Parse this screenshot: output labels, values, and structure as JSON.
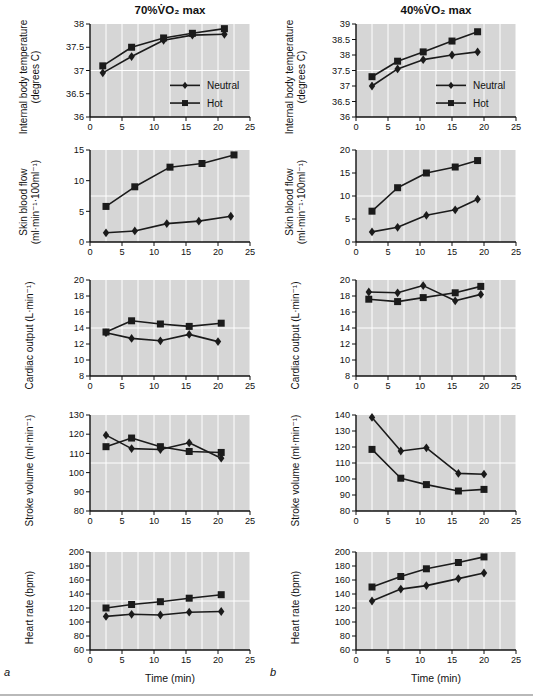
{
  "figure": {
    "panel_a_letter": "a",
    "panel_b_letter": "b",
    "legend_labels": {
      "neutral": "Neutral",
      "hot": "Hot"
    },
    "grid": {
      "x_step": 2.5,
      "y_mid_line": true,
      "style": "white gridlines on gray plot background"
    }
  },
  "colors": {
    "page_bg": "#ffffff",
    "plot_bg": "#d6d6d6",
    "gridline": "#ffffff",
    "series_line": "#1b1b1b",
    "text": "#111111",
    "bottom_rule": "#b9b9b9"
  },
  "chart_data": [
    {
      "id": "temp-70",
      "type": "line",
      "title": "70%V̇O₂ max",
      "ylabel_lines": [
        "Internal body temperature",
        "(degrees C)"
      ],
      "ylim": [
        36,
        38
      ],
      "yticks": [
        36,
        36.5,
        37,
        37.5,
        38
      ],
      "xlim": [
        0,
        25
      ],
      "xticks": [
        0,
        5,
        10,
        15,
        20,
        25
      ],
      "xlabel": "",
      "legend": true,
      "panel_letter": "",
      "series": [
        {
          "name": "Neutral",
          "marker": "diamond",
          "points": [
            [
              2,
              36.95
            ],
            [
              6.5,
              37.3
            ],
            [
              11.5,
              37.65
            ],
            [
              16,
              37.76
            ],
            [
              21,
              37.78
            ]
          ]
        },
        {
          "name": "Hot",
          "marker": "square",
          "points": [
            [
              2,
              37.1
            ],
            [
              6.5,
              37.5
            ],
            [
              11.5,
              37.7
            ],
            [
              16,
              37.8
            ],
            [
              21,
              37.9
            ]
          ]
        }
      ]
    },
    {
      "id": "temp-40",
      "type": "line",
      "title": "40%V̇O₂ max",
      "ylabel_lines": [
        "Internal body temperature",
        "(degrees C)"
      ],
      "ylim": [
        36,
        39
      ],
      "yticks": [
        36,
        36.5,
        37,
        37.5,
        38,
        38.5,
        39
      ],
      "xlim": [
        0,
        25
      ],
      "xticks": [
        0,
        5,
        10,
        15,
        20,
        25
      ],
      "xlabel": "",
      "legend": true,
      "panel_letter": "",
      "series": [
        {
          "name": "Neutral",
          "marker": "diamond",
          "points": [
            [
              2.5,
              37.0
            ],
            [
              6.5,
              37.55
            ],
            [
              10.5,
              37.85
            ],
            [
              15,
              38.0
            ],
            [
              19,
              38.1
            ]
          ]
        },
        {
          "name": "Hot",
          "marker": "square",
          "points": [
            [
              2.5,
              37.3
            ],
            [
              6.5,
              37.8
            ],
            [
              10.5,
              38.1
            ],
            [
              15,
              38.45
            ],
            [
              19,
              38.75
            ]
          ]
        }
      ]
    },
    {
      "id": "sbf-70",
      "type": "line",
      "title": "",
      "ylabel_lines": [
        "Skin blood flow",
        "(ml·min⁻¹·100ml⁻¹)"
      ],
      "ylim": [
        0,
        15
      ],
      "yticks": [
        0,
        5,
        10,
        15
      ],
      "xlim": [
        0,
        25
      ],
      "xticks": [
        0,
        5,
        10,
        15,
        20,
        25
      ],
      "xlabel": "",
      "legend": false,
      "panel_letter": "",
      "series": [
        {
          "name": "Neutral",
          "marker": "diamond",
          "points": [
            [
              2.5,
              1.5
            ],
            [
              7,
              1.8
            ],
            [
              12,
              3.0
            ],
            [
              17,
              3.4
            ],
            [
              22,
              4.2
            ]
          ]
        },
        {
          "name": "Hot",
          "marker": "square",
          "points": [
            [
              2.5,
              5.8
            ],
            [
              7,
              9.0
            ],
            [
              12.5,
              12.2
            ],
            [
              17.5,
              12.8
            ],
            [
              22.5,
              14.2
            ]
          ]
        }
      ]
    },
    {
      "id": "sbf-40",
      "type": "line",
      "title": "",
      "ylabel_lines": [
        "Skin blood flow",
        "(ml·min⁻¹·100ml⁻¹)"
      ],
      "ylim": [
        0,
        20
      ],
      "yticks": [
        0,
        5,
        10,
        15,
        20
      ],
      "xlim": [
        0,
        25
      ],
      "xticks": [
        0,
        5,
        10,
        15,
        20,
        25
      ],
      "xlabel": "",
      "legend": false,
      "panel_letter": "",
      "series": [
        {
          "name": "Neutral",
          "marker": "diamond",
          "points": [
            [
              2.5,
              2.2
            ],
            [
              6.5,
              3.2
            ],
            [
              11,
              5.8
            ],
            [
              15.5,
              7.0
            ],
            [
              19,
              9.3
            ]
          ]
        },
        {
          "name": "Hot",
          "marker": "square",
          "points": [
            [
              2.5,
              6.7
            ],
            [
              6.5,
              11.8
            ],
            [
              11,
              15.0
            ],
            [
              15.5,
              16.3
            ],
            [
              19,
              17.7
            ]
          ]
        }
      ]
    },
    {
      "id": "co-70",
      "type": "line",
      "title": "",
      "ylabel_lines": [
        "Cardiac output (L·min⁻¹)"
      ],
      "ylim": [
        8,
        20
      ],
      "yticks": [
        8,
        10,
        12,
        14,
        16,
        18,
        20
      ],
      "xlim": [
        0,
        25
      ],
      "xticks": [
        0,
        5,
        10,
        15,
        20,
        25
      ],
      "xlabel": "",
      "legend": false,
      "panel_letter": "",
      "series": [
        {
          "name": "Neutral",
          "marker": "diamond",
          "points": [
            [
              2.5,
              13.4
            ],
            [
              6.5,
              12.7
            ],
            [
              11,
              12.4
            ],
            [
              15.5,
              13.2
            ],
            [
              20,
              12.3
            ]
          ]
        },
        {
          "name": "Hot",
          "marker": "square",
          "points": [
            [
              2.5,
              13.5
            ],
            [
              6.5,
              14.9
            ],
            [
              11,
              14.5
            ],
            [
              15.5,
              14.2
            ],
            [
              20.5,
              14.6
            ]
          ]
        }
      ]
    },
    {
      "id": "co-40",
      "type": "line",
      "title": "",
      "ylabel_lines": [
        "Cardiac output (L·min⁻¹)"
      ],
      "ylim": [
        8,
        20
      ],
      "yticks": [
        8,
        10,
        12,
        14,
        16,
        18,
        20
      ],
      "xlim": [
        0,
        25
      ],
      "xticks": [
        0,
        5,
        10,
        15,
        20,
        25
      ],
      "xlabel": "",
      "legend": false,
      "panel_letter": "",
      "series": [
        {
          "name": "Neutral",
          "marker": "diamond",
          "points": [
            [
              2,
              18.5
            ],
            [
              6.5,
              18.4
            ],
            [
              10.5,
              19.3
            ],
            [
              15.5,
              17.4
            ],
            [
              19.5,
              18.2
            ]
          ]
        },
        {
          "name": "Hot",
          "marker": "square",
          "points": [
            [
              2,
              17.6
            ],
            [
              6.5,
              17.3
            ],
            [
              10.5,
              17.8
            ],
            [
              15.5,
              18.4
            ],
            [
              19.5,
              19.2
            ]
          ]
        }
      ]
    },
    {
      "id": "sv-70",
      "type": "line",
      "title": "",
      "ylabel_lines": [
        "Stroke volume (ml·min⁻¹)"
      ],
      "ylim": [
        80,
        130
      ],
      "yticks": [
        80,
        90,
        100,
        110,
        120,
        130
      ],
      "xlim": [
        0,
        25
      ],
      "xticks": [
        0,
        5,
        10,
        15,
        20,
        25
      ],
      "xlabel": "",
      "legend": false,
      "panel_letter": "",
      "series": [
        {
          "name": "Neutral",
          "marker": "diamond",
          "points": [
            [
              2.5,
              119.5
            ],
            [
              6.5,
              112.5
            ],
            [
              11,
              112
            ],
            [
              15.5,
              115.5
            ],
            [
              20.5,
              107.5
            ]
          ]
        },
        {
          "name": "Hot",
          "marker": "square",
          "points": [
            [
              2.5,
              113.5
            ],
            [
              6.5,
              118
            ],
            [
              11,
              113.5
            ],
            [
              15.5,
              111
            ],
            [
              20.5,
              110.5
            ]
          ]
        }
      ]
    },
    {
      "id": "sv-40",
      "type": "line",
      "title": "",
      "ylabel_lines": [
        "Stroke volume (ml·min⁻¹)"
      ],
      "ylim": [
        80,
        140
      ],
      "yticks": [
        80,
        90,
        100,
        110,
        120,
        130,
        140
      ],
      "xlim": [
        0,
        25
      ],
      "xticks": [
        0,
        5,
        10,
        15,
        20,
        25
      ],
      "xlabel": "",
      "legend": false,
      "panel_letter": "",
      "series": [
        {
          "name": "Neutral",
          "marker": "diamond",
          "points": [
            [
              2.5,
              138.5
            ],
            [
              7,
              117.5
            ],
            [
              11,
              119.5
            ],
            [
              16,
              103.5
            ],
            [
              20,
              103
            ]
          ]
        },
        {
          "name": "Hot",
          "marker": "square",
          "points": [
            [
              2.5,
              118.5
            ],
            [
              7,
              100.5
            ],
            [
              11,
              96.5
            ],
            [
              16,
              92.5
            ],
            [
              20,
              93.5
            ]
          ]
        }
      ]
    },
    {
      "id": "hr-70",
      "type": "line",
      "title": "",
      "ylabel_lines": [
        "Heart rate (bpm)"
      ],
      "ylim": [
        60,
        200
      ],
      "yticks": [
        60,
        80,
        100,
        120,
        140,
        160,
        180,
        200
      ],
      "xlim": [
        0,
        25
      ],
      "xticks": [
        0,
        5,
        10,
        15,
        20,
        25
      ],
      "xlabel": "Time (min)",
      "legend": false,
      "panel_letter": "a",
      "series": [
        {
          "name": "Neutral",
          "marker": "diamond",
          "points": [
            [
              2.5,
              108
            ],
            [
              6.5,
              111
            ],
            [
              11,
              110
            ],
            [
              15.5,
              114
            ],
            [
              20.5,
              115
            ]
          ]
        },
        {
          "name": "Hot",
          "marker": "square",
          "points": [
            [
              2.5,
              120
            ],
            [
              6.5,
              125
            ],
            [
              11,
              129
            ],
            [
              15.5,
              134
            ],
            [
              20.5,
              139
            ]
          ]
        }
      ]
    },
    {
      "id": "hr-40",
      "type": "line",
      "title": "",
      "ylabel_lines": [
        "Heart rate (bpm)"
      ],
      "ylim": [
        60,
        200
      ],
      "yticks": [
        60,
        80,
        100,
        120,
        140,
        160,
        180,
        200
      ],
      "xlim": [
        0,
        25
      ],
      "xticks": [
        0,
        5,
        10,
        15,
        20,
        25
      ],
      "xlabel": "Time (min)",
      "legend": false,
      "panel_letter": "b",
      "series": [
        {
          "name": "Neutral",
          "marker": "diamond",
          "points": [
            [
              2.5,
              130
            ],
            [
              7,
              147
            ],
            [
              11,
              152
            ],
            [
              16,
              162
            ],
            [
              20,
              170
            ]
          ]
        },
        {
          "name": "Hot",
          "marker": "square",
          "points": [
            [
              2.5,
              150
            ],
            [
              7,
              165
            ],
            [
              11,
              176
            ],
            [
              16,
              185
            ],
            [
              20,
              193
            ]
          ]
        }
      ]
    }
  ]
}
